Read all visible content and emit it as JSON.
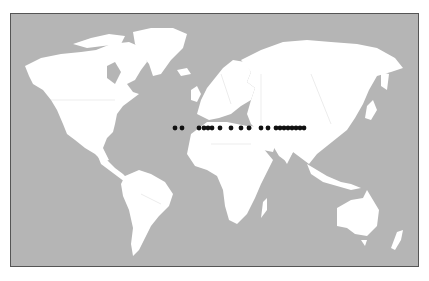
{
  "map": {
    "type": "world-map",
    "projection": "robinson-like",
    "colors": {
      "ocean": "#b5b5b5",
      "land": "#ffffff",
      "borders": "#d8d8d8",
      "frame": "#555555",
      "markers": "#111111"
    },
    "markers": {
      "description": "row of black dots along ~30°N latitude from Atlantic to China",
      "y": 127,
      "x_positions": [
        174,
        181,
        198,
        203,
        207,
        211,
        219,
        230,
        240,
        248,
        260,
        267,
        275,
        279,
        283,
        287,
        291,
        295,
        299,
        303
      ]
    },
    "regions": [
      "North America",
      "Greenland",
      "South America",
      "Europe",
      "Africa",
      "Asia",
      "Australia",
      "New Zealand"
    ]
  }
}
